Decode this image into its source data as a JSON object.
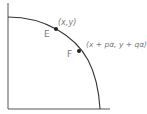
{
  "diagram": {
    "type": "quarter-circle curve with two marked points",
    "axes": {
      "x_axis": "horizontal baseline",
      "y_axis": "vertical left axis"
    },
    "curve": {
      "shape": "concave arc from top of y-axis to x-axis",
      "color": "#333333"
    },
    "points": [
      {
        "name": "E",
        "label": "E",
        "coord_label": "(x,y)"
      },
      {
        "name": "F",
        "label": "F",
        "coord_label": "(x + pα, y + qα)"
      }
    ],
    "colors": {
      "line": "#333333",
      "text": "#7a7a7a",
      "point": "#222222",
      "background": "#ffffff"
    }
  }
}
